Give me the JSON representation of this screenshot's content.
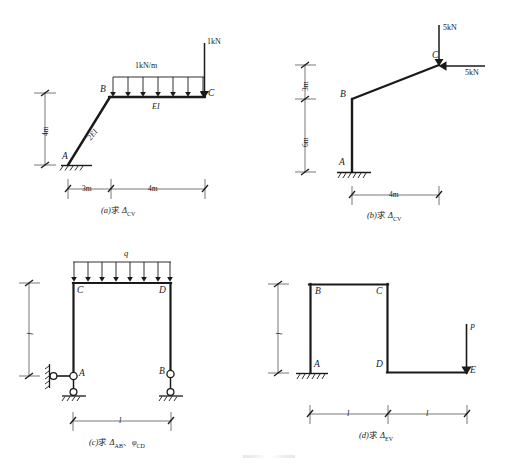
{
  "figures": [
    {
      "id": "a",
      "caption_prefix": "(a)",
      "caption_cn": "求",
      "caption_sym": "Δ",
      "caption_sub": "CV",
      "nodes": [
        {
          "name": "A"
        },
        {
          "name": "B"
        },
        {
          "name": "C"
        }
      ],
      "members": [
        {
          "label": "2EI"
        },
        {
          "label": "EI"
        }
      ],
      "loads": [
        {
          "label": "1kN/m",
          "type": "distributed"
        },
        {
          "label": "1kN",
          "type": "point-down"
        }
      ],
      "dimensions": [
        {
          "label": "4m",
          "orientation": "vertical"
        },
        {
          "label": "3m",
          "orientation": "horizontal"
        },
        {
          "label": "4m",
          "orientation": "horizontal"
        }
      ]
    },
    {
      "id": "b",
      "caption_prefix": "(b)",
      "caption_cn": "求",
      "caption_sym": "Δ",
      "caption_sub": "CV",
      "nodes": [
        {
          "name": "A"
        },
        {
          "name": "B"
        },
        {
          "name": "C"
        }
      ],
      "members": [],
      "loads": [
        {
          "label": "5kN",
          "type": "point-down"
        },
        {
          "label": "5kN",
          "type": "point-left"
        }
      ],
      "dimensions": [
        {
          "label": "3m",
          "orientation": "vertical"
        },
        {
          "label": "6m",
          "orientation": "vertical"
        },
        {
          "label": "4m",
          "orientation": "horizontal"
        }
      ]
    },
    {
      "id": "c",
      "caption_prefix": "(c)",
      "caption_cn": "求",
      "caption_sym": "Δ",
      "caption_sub": "AB",
      "caption_sep": "、",
      "caption_sym2": "φ",
      "caption_sub2": "CD",
      "nodes": [
        {
          "name": "A"
        },
        {
          "name": "B"
        },
        {
          "name": "C"
        },
        {
          "name": "D"
        }
      ],
      "members": [],
      "loads": [
        {
          "label": "q",
          "type": "distributed"
        }
      ],
      "dimensions": [
        {
          "label": "l",
          "orientation": "vertical"
        },
        {
          "label": "l",
          "orientation": "horizontal"
        }
      ]
    },
    {
      "id": "d",
      "caption_prefix": "(d)",
      "caption_cn": "求",
      "caption_sym": "Δ",
      "caption_sub": "EV",
      "nodes": [
        {
          "name": "A"
        },
        {
          "name": "B"
        },
        {
          "name": "C"
        },
        {
          "name": "D"
        },
        {
          "name": "E"
        }
      ],
      "members": [],
      "loads": [
        {
          "label": "P",
          "type": "point-down"
        }
      ],
      "dimensions": [
        {
          "label": "l",
          "orientation": "vertical"
        },
        {
          "label": "l",
          "orientation": "horizontal"
        },
        {
          "label": "l",
          "orientation": "horizontal"
        }
      ]
    }
  ],
  "colors": {
    "ink": "#1a1a1a",
    "dim_line": "#555555",
    "paper": "#ffffff"
  }
}
